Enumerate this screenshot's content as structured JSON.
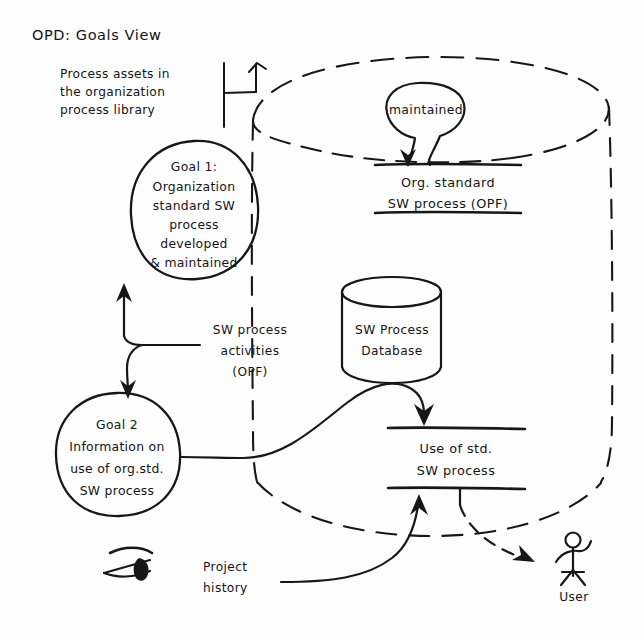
{
  "diagram": {
    "title": "OPD: Goals View",
    "notation": "hand-drawn sketch",
    "boundary": {
      "name": "process-assets-boundary",
      "style": "dashed-cylinder",
      "label_lines": [
        "Process assets in",
        "the organization",
        "process library"
      ]
    },
    "nodes": [
      {
        "id": "goal-1",
        "shape": "ellipse",
        "lines": [
          "Goal 1:",
          "Organization",
          "standard SW",
          "process",
          "developed",
          "& maintained"
        ]
      },
      {
        "id": "goal-2",
        "shape": "ellipse",
        "lines": [
          "Goal 2",
          "Information on",
          "use of org.std.",
          "SW process"
        ]
      },
      {
        "id": "org-standard-sw-process",
        "shape": "object-bars",
        "lines": [
          "Org. standard",
          "SW process (OPF)"
        ]
      },
      {
        "id": "use-of-std-sw-process",
        "shape": "object-bars",
        "lines": [
          "Use of std.",
          "SW process"
        ]
      },
      {
        "id": "sw-process-database",
        "shape": "cylinder",
        "lines": [
          "SW Process",
          "Database"
        ]
      },
      {
        "id": "maintained-bubble",
        "shape": "speech-bubble",
        "lines": [
          "maintained"
        ]
      },
      {
        "id": "user-actor",
        "shape": "stick-figure",
        "label": "User"
      },
      {
        "id": "viewpoint-eye",
        "shape": "eye-icon",
        "label": ""
      }
    ],
    "edge_labels": [
      {
        "id": "sw-process-activities",
        "lines": [
          "SW process",
          "activities",
          "(OPF)"
        ]
      },
      {
        "id": "project-history",
        "lines": [
          "Project",
          "history"
        ]
      }
    ],
    "colors": {
      "ink": "#17171a",
      "background": "#fefefe"
    }
  }
}
